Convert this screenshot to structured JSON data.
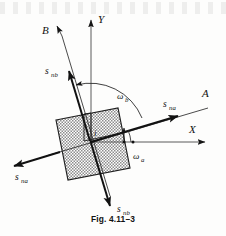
{
  "figure": {
    "caption": "Fig. 4.11–3"
  },
  "axes": {
    "x_label": "X",
    "y_label": "Y",
    "a_label": "A",
    "b_label": "B"
  },
  "body": {
    "origin_label": "i",
    "fill_color": "#b6b6b6",
    "stroke_color": "#1a1a1a"
  },
  "vectors": [
    {
      "id": "s-nb-upper",
      "label": "s",
      "subscript": "nb",
      "direction": "upper-left"
    },
    {
      "id": "s-nb-lower",
      "label": "s",
      "subscript": "nb",
      "direction": "lower-right"
    },
    {
      "id": "s-na-right",
      "label": "s",
      "subscript": "na",
      "direction": "upper-right"
    },
    {
      "id": "s-na-left",
      "label": "s",
      "subscript": "na",
      "direction": "lower-left"
    }
  ],
  "angles": [
    {
      "id": "omega-b",
      "symbol": "ω",
      "subscript": "b"
    },
    {
      "id": "omega-a",
      "symbol": "ω",
      "subscript": "a"
    }
  ],
  "colors": {
    "ink": "#111111",
    "axis_gray": "#4a4a4a",
    "hatch": "#9a9a9a",
    "background": "#fdfdfc"
  }
}
